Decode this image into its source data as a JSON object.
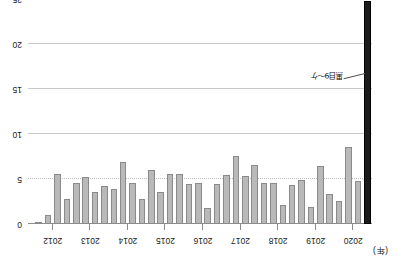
{
  "chart_data": {
    "type": "bar",
    "title": "",
    "subtitle": "",
    "xlabel": "(年)",
    "ylabel": "",
    "unit_note": "(年)",
    "orientation": "bars-hang-down-from-zero",
    "grid": true,
    "legend_position": "none",
    "ylim": [
      0,
      25
    ],
    "y_ticks": [
      "0",
      "5",
      "10",
      "15",
      "20",
      "25"
    ],
    "y_tick_values": [
      0,
      5,
      10,
      15,
      20,
      25
    ],
    "x_tick_labels": [
      "2020",
      "2019",
      "2018",
      "2017",
      "2016",
      "2015",
      "2014",
      "2013",
      "2012"
    ],
    "categories": [
      "2020Q4",
      "2020Q3",
      "2020Q2",
      "2020Q1",
      "2019Q4",
      "2019Q3",
      "2019Q2",
      "2019Q1",
      "2018Q4",
      "2018Q3",
      "2018Q2",
      "2018Q1",
      "2017Q4",
      "2017Q3",
      "2017Q2",
      "2017Q1",
      "2016Q4",
      "2016Q3",
      "2016Q2",
      "2016Q1",
      "2015Q4",
      "2015Q3",
      "2015Q2",
      "2015Q1",
      "2014Q4",
      "2014Q3",
      "2014Q2",
      "2014Q1",
      "2013Q4",
      "2013Q3",
      "2013Q2",
      "2013Q1",
      "2012Q4",
      "2012Q3",
      "2012Q2",
      "2012Q1"
    ],
    "values": [
      24.8,
      4.8,
      8.5,
      2.6,
      3.3,
      6.4,
      1.9,
      4.9,
      4.3,
      2.1,
      4.6,
      4.6,
      6.5,
      5.3,
      7.6,
      5.4,
      4.4,
      1.8,
      4.6,
      4.4,
      5.6,
      5.6,
      3.6,
      6.0,
      2.8,
      4.6,
      6.9,
      3.9,
      4.2,
      3.6,
      5.2,
      4.6,
      2.8,
      5.6,
      1.0,
      0.2
    ],
    "highlight_index": 0,
    "highlight_color": "#1b1b1b",
    "bar_color": "#b9b9b9",
    "bar_edge_color": "#8a8a8a",
    "annotation": {
      "text": "黒目9〜ケ",
      "target_index": 0
    }
  },
  "footnote": ""
}
